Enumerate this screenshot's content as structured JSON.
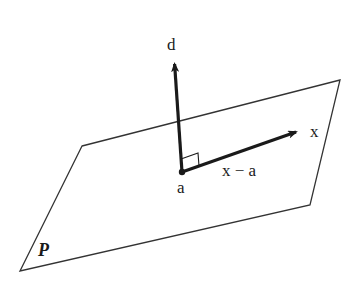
{
  "figure": {
    "colors": {
      "background": "#ffffff",
      "stroke": "#1a1a1a"
    },
    "plane": {
      "label": "P",
      "corners": [
        [
          82,
          146
        ],
        [
          340,
          80
        ],
        [
          310,
          205
        ],
        [
          20,
          271
        ]
      ]
    },
    "point": {
      "label": "a",
      "position": [
        182,
        172
      ]
    },
    "normal_vector": {
      "label": "d",
      "from": [
        182,
        172
      ],
      "to": [
        174,
        58
      ]
    },
    "in_plane_vector": {
      "tip_label": "x",
      "segment_label": "x − a",
      "from": [
        182,
        172
      ],
      "to": [
        302,
        130
      ]
    },
    "right_angle_marker": true
  }
}
